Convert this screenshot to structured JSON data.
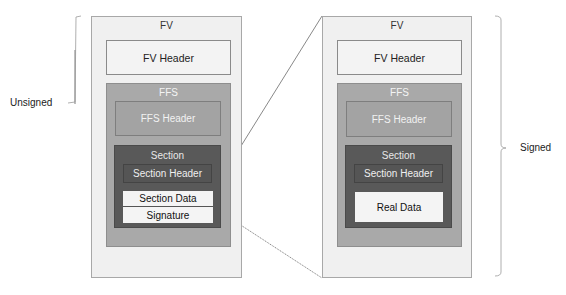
{
  "left_panel": {
    "bracket_label": "Unsigned",
    "fv": {
      "title": "FV",
      "header": "FV Header",
      "ffs": {
        "title": "FFS",
        "header": "FFS Header",
        "section": {
          "title": "Section",
          "header": "Section Header",
          "data": "Section Data",
          "signature": "Signature"
        }
      }
    }
  },
  "right_panel": {
    "bracket_label": "Signed",
    "fv": {
      "title": "FV",
      "header": "FV Header",
      "ffs": {
        "title": "FFS",
        "header": "FFS Header",
        "section": {
          "title": "Section",
          "header": "Section Header",
          "data": "Real Data"
        }
      }
    }
  },
  "colors": {
    "fv_fill": "#f0f0f0",
    "ffs_fill": "#a9a9a9",
    "section_fill": "#595959",
    "data_fill": "#f4f4f4",
    "line": "#555555"
  }
}
